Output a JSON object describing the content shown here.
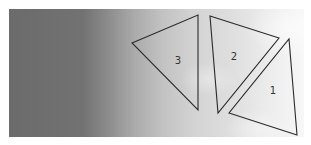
{
  "figure": {
    "background": {
      "description": "grayscale cloud/sky photograph, dark on left fading to white on right",
      "left_color": "#6b6b6b",
      "right_color": "#f7f7f7"
    },
    "stroke_color": "#2a2a2a",
    "triangles": [
      {
        "label": "1",
        "points": "289,39 297,135 229,113",
        "label_pos": [
          273,
          94
        ]
      },
      {
        "label": "2",
        "points": "210,16 279,38 218,113",
        "label_pos": [
          234,
          60
        ]
      },
      {
        "label": "3",
        "points": "132,43 198,15 198,110",
        "label_pos": [
          178,
          64
        ]
      }
    ]
  }
}
